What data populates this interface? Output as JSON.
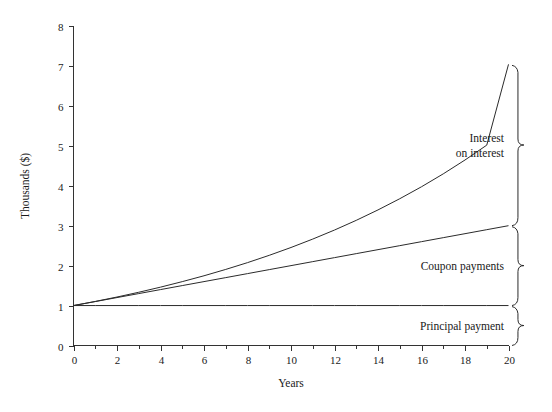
{
  "chart_data": {
    "type": "line",
    "title": "",
    "xlabel": "Years",
    "ylabel": "Thousands ($)",
    "xlim": [
      0,
      20
    ],
    "ylim": [
      0,
      8
    ],
    "grid": false,
    "legend_position": "none",
    "x_ticks": [
      0,
      2,
      4,
      6,
      8,
      10,
      12,
      14,
      16,
      18,
      20
    ],
    "x_tick_labels": [
      "0",
      "2",
      "4",
      "6",
      "8",
      "10",
      "12",
      "14",
      "16",
      "18",
      "20"
    ],
    "x_minor_ticks": [
      1,
      3,
      5,
      7,
      9,
      11,
      13,
      15,
      17,
      19
    ],
    "y_ticks": [
      0,
      1,
      2,
      3,
      4,
      5,
      6,
      7,
      8
    ],
    "y_tick_labels": [
      "0",
      "1",
      "2",
      "3",
      "4",
      "5",
      "6",
      "7",
      "8"
    ],
    "x": [
      0,
      1,
      2,
      3,
      4,
      5,
      6,
      7,
      8,
      9,
      10,
      11,
      12,
      13,
      14,
      15,
      16,
      17,
      18,
      19,
      20
    ],
    "series": [
      {
        "name": "Total value (principal + coupons + interest on interest)",
        "values": [
          1.0,
          1.103,
          1.214,
          1.333,
          1.461,
          1.599,
          1.746,
          1.905,
          2.075,
          2.258,
          2.454,
          2.665,
          2.891,
          3.134,
          3.395,
          3.675,
          3.975,
          4.298,
          4.645,
          5.017,
          7.04
        ]
      },
      {
        "name": "Principal + coupon payments",
        "values": [
          1.0,
          1.1,
          1.2,
          1.3,
          1.4,
          1.5,
          1.6,
          1.7,
          1.8,
          1.9,
          2.0,
          2.1,
          2.2,
          2.3,
          2.4,
          2.5,
          2.6,
          2.7,
          2.8,
          2.9,
          3.0
        ]
      },
      {
        "name": "Principal",
        "values": [
          1.0,
          1.0,
          1.0,
          1.0,
          1.0,
          1.0,
          1.0,
          1.0,
          1.0,
          1.0,
          1.0,
          1.0,
          1.0,
          1.0,
          1.0,
          1.0,
          1.0,
          1.0,
          1.0,
          1.0,
          1.0
        ]
      }
    ],
    "annotations": [
      {
        "label_line1": "Interest",
        "label_line2": "on interest",
        "brace_from": 3.0,
        "brace_to": 7.04
      },
      {
        "label_line1": "Coupon payments",
        "label_line2": "",
        "brace_from": 1.0,
        "brace_to": 3.0
      },
      {
        "label_line1": "Principal payment",
        "label_line2": "",
        "brace_from": 0.0,
        "brace_to": 1.0
      }
    ]
  },
  "colors": {
    "line": "#2b2b2b",
    "axis": "#333333",
    "text": "#1a1a1a",
    "background": "#ffffff"
  }
}
